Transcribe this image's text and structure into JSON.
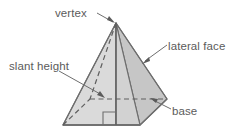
{
  "diagram": {
    "shape": "square-pyramid",
    "labels": {
      "vertex": "vertex",
      "lateral_face": "lateral face",
      "slant_height": "slant height",
      "base": "base"
    },
    "colors": {
      "background": "#ffffff",
      "text": "#5b5b5b",
      "outline": "#6e6e6e",
      "leader": "#6e6e6e",
      "face_front_left": "#d9d9d9",
      "face_front_right": "#cfcfcf",
      "face_right": "#c6c6c6",
      "base_right": "#c2c2c2"
    },
    "geometry": {
      "apex": [
        116,
        23
      ],
      "base_front_left": [
        63,
        125
      ],
      "base_front_right": [
        140,
        125
      ],
      "base_right": [
        167,
        99
      ],
      "base_back_hidden": [
        90,
        99
      ],
      "right_angle_marker": [
        113,
        112
      ]
    },
    "leaders": [
      {
        "name": "vertex",
        "from": [
          98,
          13
        ],
        "to": [
          114,
          23
        ],
        "arrow": true
      },
      {
        "name": "lateral-face",
        "from": [
          166,
          45
        ],
        "to": [
          144,
          62
        ],
        "arrow": true
      },
      {
        "name": "slant-height",
        "from": [
          60,
          70
        ],
        "to": [
          104,
          97
        ],
        "arrow": true
      },
      {
        "name": "base",
        "from": [
          170,
          108
        ],
        "to": [
          152,
          99
        ],
        "arrow": true
      }
    ]
  }
}
